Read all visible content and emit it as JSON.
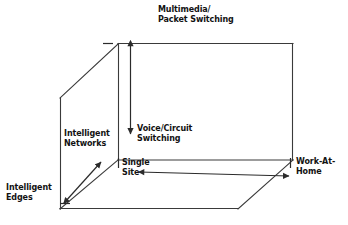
{
  "figure": {
    "kind": "cube-axes-diagram",
    "background_color": "#ffffff",
    "line_color": "#3a3a3a",
    "text_color": "#121212"
  },
  "labels": {
    "multimedia_packet_switching": "Multimedia/\nPacket Switching",
    "voice_circuit_switching": "Voice/Circuit\nSwitching",
    "intelligent_networks": "Intelligent\nNetworks",
    "intelligent_edges": "Intelligent\nEdges",
    "single_site": "Single\nSite",
    "work_at_home": "Work-At-\nHome"
  },
  "axes": [
    {
      "name": "vertical-axis",
      "arrow_type": "double-headed",
      "orientation": "vertical",
      "top_label": "Multimedia/\nPacket Switching",
      "bottom_label": "Voice/Circuit\nSwitching"
    },
    {
      "name": "horizontal-axis",
      "arrow_type": "double-headed",
      "orientation": "horizontal",
      "left_label": "Single\nSite",
      "right_label": "Work-At-\nHome"
    },
    {
      "name": "depth-axis",
      "arrow_type": "double-headed",
      "orientation": "diagonal",
      "upper_label": "Intelligent\nNetworks",
      "lower_label": "Intelligent\nEdges"
    }
  ]
}
